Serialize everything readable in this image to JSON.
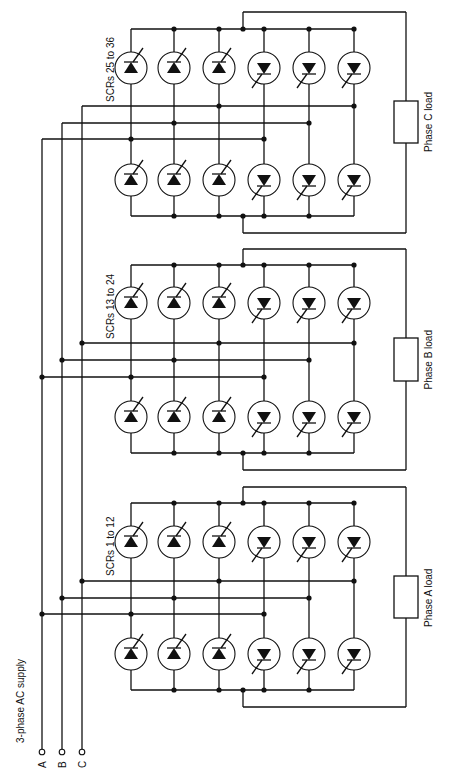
{
  "diagram": {
    "type": "circuit-schematic",
    "orientation": "rotated-90",
    "colors": {
      "ink": "#111111",
      "background": "#ffffff"
    },
    "supply": {
      "label": "3-phase AC supply",
      "phases": [
        {
          "id": "A",
          "label": "A",
          "x": 42
        },
        {
          "id": "B",
          "label": "B",
          "x": 62
        },
        {
          "id": "C",
          "label": "C",
          "x": 82
        }
      ],
      "terminal_y": 752
    },
    "scr_columns_x": [
      131,
      174,
      219,
      264,
      309,
      354
    ],
    "groups": [
      {
        "id": "C",
        "scr_label": "SCRs 25 to 36",
        "load_label": "Phase C load",
        "top_bus_y": 29,
        "upper_scr_y": 68,
        "bus_y": {
          "C": 106,
          "B": 123,
          "A": 139
        },
        "lower_scr_y": 180,
        "bottom_bus_y": 216,
        "load_top_y": 12,
        "load_bottom_y": 233,
        "load_box": {
          "y1": 101,
          "y2": 143
        },
        "label_y": 56
      },
      {
        "id": "B",
        "scr_label": "SCRs 13 to 24",
        "load_label": "Phase B load",
        "top_bus_y": 265,
        "upper_scr_y": 303,
        "bus_y": {
          "C": 343,
          "B": 360,
          "A": 377
        },
        "lower_scr_y": 417,
        "bottom_bus_y": 453,
        "load_top_y": 249,
        "load_bottom_y": 470,
        "load_box": {
          "y1": 338,
          "y2": 381
        },
        "label_y": 293
      },
      {
        "id": "A",
        "scr_label": "SCRs 1 to 12",
        "load_label": "Phase A load",
        "top_bus_y": 503,
        "upper_scr_y": 542,
        "bus_y": {
          "C": 581,
          "B": 598,
          "A": 614
        },
        "lower_scr_y": 654,
        "bottom_bus_y": 690,
        "load_top_y": 487,
        "load_bottom_y": 707,
        "load_box": {
          "y1": 576,
          "y2": 618
        },
        "label_y": 530
      }
    ],
    "scr_polarity": [
      "up",
      "up",
      "up",
      "down",
      "down",
      "down"
    ],
    "bus_connections": {
      "C": [
        2,
        5
      ],
      "B": [
        1,
        4
      ],
      "A": [
        0,
        3
      ]
    },
    "load_x": 406,
    "load_tap_x": 243
  }
}
